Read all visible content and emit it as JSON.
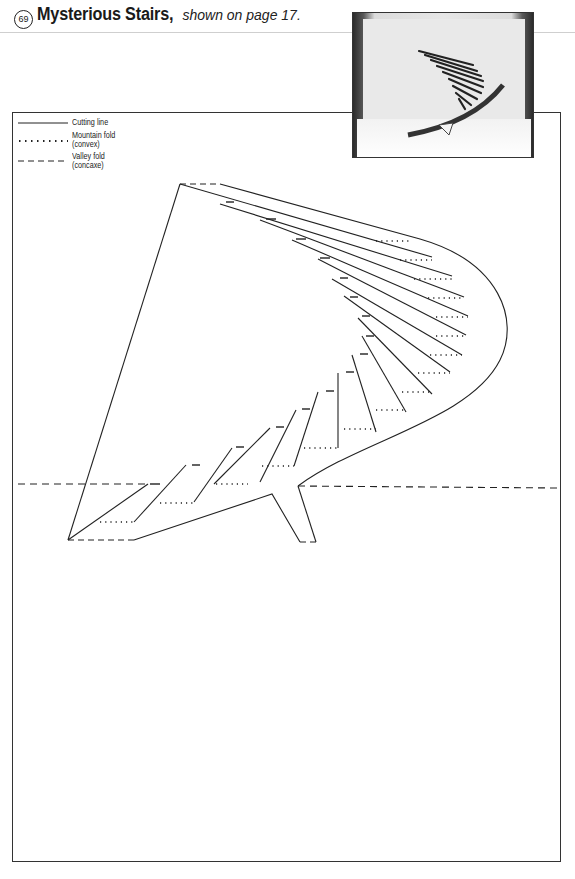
{
  "header": {
    "number": "69",
    "title": "Mysterious Stairs,",
    "subtitle": "shown on page 17."
  },
  "legend": {
    "items": [
      {
        "type": "cutting",
        "label_line1": "Cutting line",
        "label_line2": ""
      },
      {
        "type": "mountain",
        "label_line1": "Mountain fold",
        "label_line2": "(convex)"
      },
      {
        "type": "valley",
        "label_line1": "Valley fold",
        "label_line2": "(concaxe)"
      }
    ]
  },
  "photo": {
    "description": "photo of finished pop-up spiral staircase card"
  },
  "colors": {
    "line": "#2a2a2a",
    "frame": "#333333",
    "rule": "#cfcfcf"
  }
}
